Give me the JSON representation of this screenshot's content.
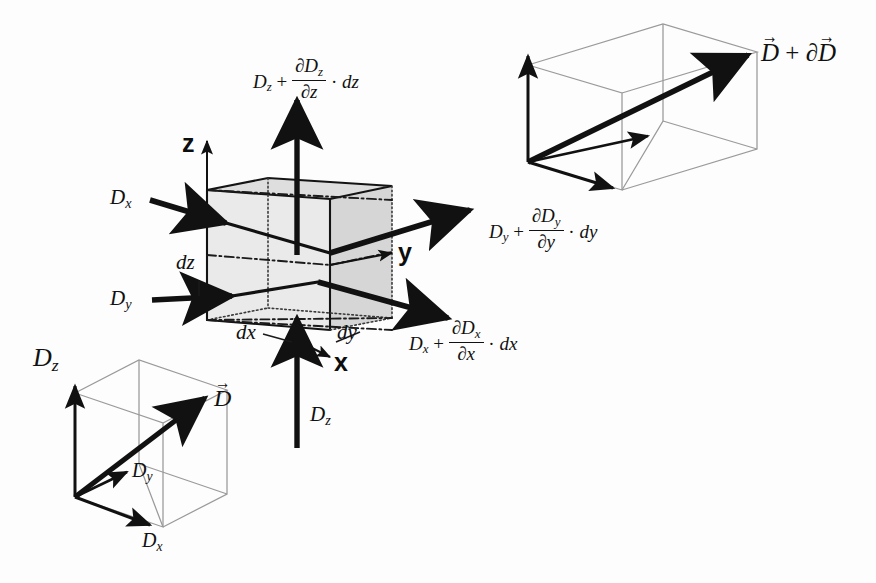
{
  "figure": {
    "background_color": "#ffffff",
    "ink_color": "#111111",
    "shade_color": "#d8d8d8",
    "wire_color": "#8a8a8a"
  },
  "main_cube": {
    "axes": {
      "z_label": "z",
      "y_label": "y",
      "x_label": "x"
    },
    "dimension_labels": {
      "dx": "dx",
      "dy": "dy",
      "dz": "dz"
    },
    "incoming": {
      "dx_in": "D",
      "dx_in_sub": "x",
      "dy_in": "D",
      "dy_in_sub": "y",
      "dz_in": "D",
      "dz_in_sub": "z"
    },
    "outgoing": {
      "dz_out_base": "D",
      "dz_out_base_sub": "z",
      "dz_out_num_partial": "∂D",
      "dz_out_num_sub": "z",
      "dz_out_den_partial": "∂z",
      "dz_out_diff": "dz",
      "dy_out_base": "D",
      "dy_out_base_sub": "y",
      "dy_out_num_partial": "∂D",
      "dy_out_num_sub": "y",
      "dy_out_den_partial": "∂y",
      "dy_out_diff": "dy",
      "dx_out_base": "D",
      "dx_out_base_sub": "x",
      "dx_out_num_partial": "∂D",
      "dx_out_num_sub": "x",
      "dx_out_den_partial": "∂x",
      "dx_out_diff": "dx",
      "plus": "+",
      "dot": "·"
    }
  },
  "inset_left": {
    "name": "vector-D-components-box",
    "vector_label": "D",
    "component_z": "D",
    "component_z_sub": "z",
    "component_y": "D",
    "component_y_sub": "y",
    "component_x": "D",
    "component_x_sub": "x"
  },
  "inset_right": {
    "name": "vector-D-plus-dD-box",
    "vector_label_lead": "D",
    "vector_label_plus": "+",
    "vector_label_partial": "∂",
    "vector_label_tail": "D"
  }
}
